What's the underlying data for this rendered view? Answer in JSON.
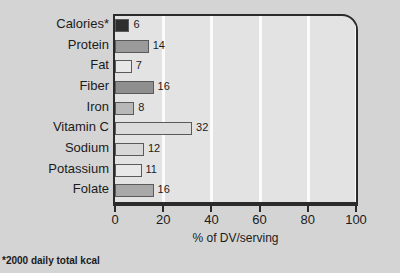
{
  "chart_data": {
    "type": "bar",
    "orientation": "horizontal",
    "title": "",
    "xlabel": "% of DV/serving",
    "ylabel": "",
    "xlim": [
      0,
      100
    ],
    "xticks": [
      0,
      20,
      40,
      60,
      80,
      100
    ],
    "grid": true,
    "legend": "none",
    "categories": [
      "Calories*",
      "Protein",
      "Fat",
      "Fiber",
      "Iron",
      "Vitamin C",
      "Sodium",
      "Potassium",
      "Folate"
    ],
    "values": [
      6,
      14,
      7,
      16,
      8,
      32,
      12,
      11,
      16
    ],
    "value_labels": [
      "6",
      "14",
      "7",
      "16",
      "8",
      "32",
      "12",
      "11",
      "16"
    ],
    "bar_colors": [
      "#2e2e2e",
      "#9a9a9a",
      "#e8e8e8",
      "#8f8f8f",
      "#b8b8b8",
      "#dcdcdc",
      "#d8d8d8",
      "#e8e8e8",
      "#a8a8a8"
    ],
    "footnote": "*2000 daily total kcal"
  },
  "colors": {
    "page_background": "#d4d4d4",
    "plot_background": "#e3e3e3",
    "gridline": "#fbfbfb",
    "axis": "#2b2b2b",
    "text": "#1b1b1b"
  }
}
